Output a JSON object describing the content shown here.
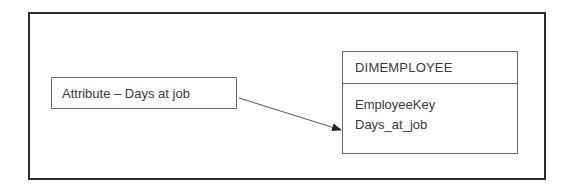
{
  "diagram": {
    "attribute_box": {
      "label": "Attribute – Days at job"
    },
    "entity": {
      "name": "DIMEMPLOYEE",
      "fields": [
        "EmployeeKey",
        "Days_at_job"
      ]
    },
    "connector": {
      "from": "attribute_box",
      "to": "entity.fields.1",
      "style": "arrow"
    },
    "colors": {
      "frame": "#2b2b2b",
      "box_border": "#6a6a6a",
      "text": "#3a3a3a",
      "background": "#ffffff"
    }
  }
}
